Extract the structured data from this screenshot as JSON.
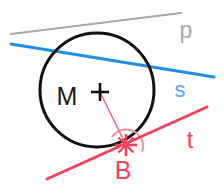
{
  "figure": {
    "canvas": {
      "width": 224,
      "height": 188,
      "background": "#ffffff"
    },
    "colors": {
      "circle": "#111111",
      "line_p": "#a8a8a8",
      "line_s": "#1f8fe8",
      "line_t": "#f2425a",
      "radius": "#e8687d",
      "angle_arc": "#f48fa5",
      "label_M": "#1a1a1a",
      "label_B": "#f2425a",
      "label_p": "#a8a8a8",
      "label_s": "#5aa8e8",
      "label_t": "#f2425a",
      "marker_M": "#111111",
      "marker_B": "#f2425a"
    },
    "circle": {
      "cx": 97,
      "cy": 90,
      "r": 57,
      "stroke_width": 3
    },
    "lines": [
      {
        "name": "p",
        "x1": 11,
        "y1": 34,
        "x2": 181,
        "y2": 13,
        "stroke_width": 2,
        "role": "non-intersecting-line"
      },
      {
        "name": "s",
        "x1": 11,
        "y1": 44,
        "x2": 214,
        "y2": 77,
        "stroke_width": 3,
        "role": "secant"
      },
      {
        "name": "t",
        "x1": 47,
        "y1": 179,
        "x2": 207,
        "y2": 107,
        "stroke_width": 3,
        "role": "tangent"
      }
    ],
    "radius_segment": {
      "from": "M",
      "to": "B",
      "x1": 100,
      "y1": 92,
      "x2": 126,
      "y2": 145,
      "stroke_width": 1.5
    },
    "angle_marker": {
      "at": "B",
      "type": "right-angle-arc",
      "radius": 17,
      "label": ""
    },
    "points": [
      {
        "name": "M",
        "label": "M",
        "cx": 100,
        "cy": 92,
        "label_x": 67,
        "label_y": 98,
        "marker": "cross"
      },
      {
        "name": "B",
        "label": "B",
        "cx": 126,
        "cy": 145,
        "label_x": 123,
        "label_y": 172,
        "marker": "cross"
      }
    ],
    "line_labels": [
      {
        "name": "p",
        "text": "p",
        "x": 186,
        "y": 32
      },
      {
        "name": "s",
        "text": "s",
        "x": 180,
        "y": 91
      },
      {
        "name": "t",
        "text": "t",
        "x": 190,
        "y": 142
      }
    ]
  }
}
